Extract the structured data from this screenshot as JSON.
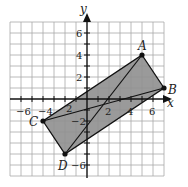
{
  "diagram": {
    "type": "coordinate-plane",
    "axes": {
      "x_label": "x",
      "y_label": "y",
      "range": [
        -7,
        7
      ]
    },
    "x_tick_labels": [
      "−6",
      "−4",
      "2",
      "4",
      "6"
    ],
    "y_tick_labels": [
      "6",
      "4",
      "2",
      "−2",
      "−6"
    ],
    "tick_label_2_neg": "2",
    "points": [
      {
        "name": "A",
        "x": 5,
        "y": 4
      },
      {
        "name": "B",
        "x": 7,
        "y": 1
      },
      {
        "name": "C",
        "x": -4,
        "y": -2
      },
      {
        "name": "D",
        "x": -2,
        "y": -5
      }
    ],
    "shape": "parallelogram ABDC with diagonals AD and BC",
    "colors": {
      "fill": "#8f8f8f",
      "grid": "#9a9a9a",
      "line": "#111111"
    }
  }
}
